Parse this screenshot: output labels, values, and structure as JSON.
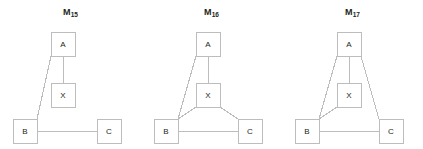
{
  "figure": {
    "width": 423,
    "height": 149,
    "background": "#ffffff",
    "line_color": "#bdbdbd",
    "text_color": "#231f20",
    "node_fill": "#ffffff"
  },
  "panels": [
    {
      "id": "M15",
      "title_base": "M",
      "title_sub": "15",
      "nodes": [
        {
          "id": "A",
          "label": "A",
          "x": 51,
          "y": 32,
          "w": 24,
          "h": 24
        },
        {
          "id": "X",
          "label": "X",
          "x": 51,
          "y": 83,
          "w": 24,
          "h": 24
        },
        {
          "id": "B",
          "label": "B",
          "x": 13,
          "y": 119,
          "w": 24,
          "h": 24
        },
        {
          "id": "C",
          "label": "C",
          "x": 97,
          "y": 119,
          "w": 24,
          "h": 24
        }
      ],
      "edges": [
        {
          "from": "A",
          "to": "X",
          "x1": 63,
          "y1": 56,
          "x2": 63,
          "y2": 83
        },
        {
          "from": "A",
          "to": "B",
          "x1": 51,
          "y1": 56,
          "x2": 37,
          "y2": 119
        },
        {
          "from": "B",
          "to": "C",
          "x1": 37,
          "y1": 131,
          "x2": 97,
          "y2": 131
        }
      ]
    },
    {
      "id": "M16",
      "title_base": "M",
      "title_sub": "16",
      "nodes": [
        {
          "id": "A",
          "label": "A",
          "x": 55,
          "y": 32,
          "w": 24,
          "h": 24
        },
        {
          "id": "X",
          "label": "X",
          "x": 55,
          "y": 83,
          "w": 24,
          "h": 24
        },
        {
          "id": "B",
          "label": "B",
          "x": 13,
          "y": 119,
          "w": 24,
          "h": 24
        },
        {
          "id": "C",
          "label": "C",
          "x": 97,
          "y": 119,
          "w": 24,
          "h": 24
        }
      ],
      "edges": [
        {
          "from": "A",
          "to": "X",
          "x1": 67,
          "y1": 56,
          "x2": 67,
          "y2": 83
        },
        {
          "from": "A",
          "to": "B",
          "x1": 55,
          "y1": 56,
          "x2": 37,
          "y2": 119
        },
        {
          "from": "X",
          "to": "B",
          "x1": 55,
          "y1": 107,
          "x2": 37,
          "y2": 119
        },
        {
          "from": "X",
          "to": "C",
          "x1": 79,
          "y1": 107,
          "x2": 97,
          "y2": 119
        },
        {
          "from": "B",
          "to": "C",
          "x1": 37,
          "y1": 131,
          "x2": 97,
          "y2": 131
        }
      ]
    },
    {
      "id": "M17",
      "title_base": "M",
      "title_sub": "17",
      "nodes": [
        {
          "id": "A",
          "label": "A",
          "x": 55,
          "y": 32,
          "w": 24,
          "h": 24
        },
        {
          "id": "X",
          "label": "X",
          "x": 55,
          "y": 83,
          "w": 24,
          "h": 24
        },
        {
          "id": "B",
          "label": "B",
          "x": 13,
          "y": 119,
          "w": 24,
          "h": 24
        },
        {
          "id": "C",
          "label": "C",
          "x": 97,
          "y": 119,
          "w": 24,
          "h": 24
        }
      ],
      "edges": [
        {
          "from": "A",
          "to": "X",
          "x1": 67,
          "y1": 56,
          "x2": 67,
          "y2": 83
        },
        {
          "from": "A",
          "to": "B",
          "x1": 55,
          "y1": 56,
          "x2": 37,
          "y2": 119
        },
        {
          "from": "A",
          "to": "C",
          "x1": 79,
          "y1": 56,
          "x2": 97,
          "y2": 119
        },
        {
          "from": "X",
          "to": "B",
          "x1": 55,
          "y1": 107,
          "x2": 37,
          "y2": 119
        },
        {
          "from": "B",
          "to": "C",
          "x1": 37,
          "y1": 131,
          "x2": 97,
          "y2": 131
        }
      ]
    }
  ],
  "chart_data": {
    "type": "diagram",
    "title": "",
    "graphs": [
      {
        "name": "M15",
        "nodes": [
          "A",
          "X",
          "B",
          "C"
        ],
        "edges": [
          [
            "A",
            "X"
          ],
          [
            "A",
            "B"
          ],
          [
            "B",
            "C"
          ]
        ],
        "edge_count": 3
      },
      {
        "name": "M16",
        "nodes": [
          "A",
          "X",
          "B",
          "C"
        ],
        "edges": [
          [
            "A",
            "X"
          ],
          [
            "A",
            "B"
          ],
          [
            "X",
            "B"
          ],
          [
            "X",
            "C"
          ],
          [
            "B",
            "C"
          ]
        ],
        "edge_count": 5
      },
      {
        "name": "M17",
        "nodes": [
          "A",
          "X",
          "B",
          "C"
        ],
        "edges": [
          [
            "A",
            "X"
          ],
          [
            "A",
            "B"
          ],
          [
            "A",
            "C"
          ],
          [
            "X",
            "B"
          ],
          [
            "B",
            "C"
          ]
        ],
        "edge_count": 5
      }
    ]
  }
}
